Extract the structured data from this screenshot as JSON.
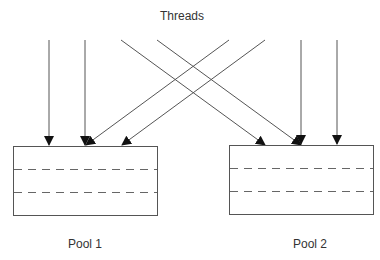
{
  "diagram": {
    "title": "Threads",
    "pools": [
      {
        "label": "Pool 1"
      },
      {
        "label": "Pool 2"
      }
    ],
    "threads": [
      {
        "from": "top",
        "to": "Pool 1"
      },
      {
        "from": "top",
        "to": "Pool 1"
      },
      {
        "from": "top",
        "to": "Pool 2"
      },
      {
        "from": "top",
        "to": "Pool 2"
      },
      {
        "from": "top",
        "to": "Pool 1"
      },
      {
        "from": "top",
        "to": "Pool 1"
      },
      {
        "from": "top",
        "to": "Pool 2"
      },
      {
        "from": "top",
        "to": "Pool 2"
      }
    ],
    "colors": {
      "line": "#555555",
      "arrowhead": "#111111",
      "text": "#333333"
    }
  }
}
